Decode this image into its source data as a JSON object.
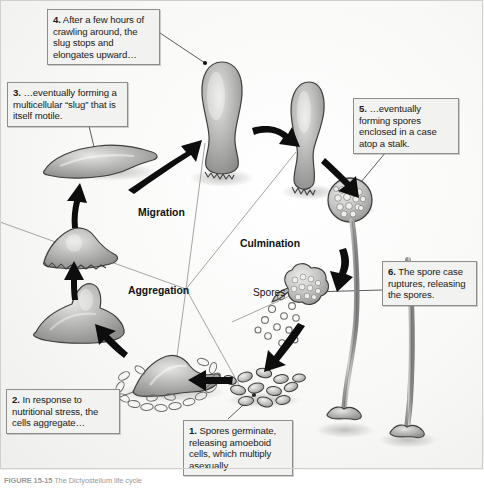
{
  "figure": {
    "caption": "FIGURE 15-15  The Dictyostelium life cycle",
    "background_color": "#ffffff",
    "body_fill_color": "#a8a8a8",
    "arrow_color": "#000000",
    "callout_fill": "#f2f2f0",
    "callout_border": "#8d8d8a"
  },
  "stages": [
    {
      "id": "migration",
      "label": "Migration"
    },
    {
      "id": "culmination",
      "label": "Culmination"
    },
    {
      "id": "aggregation",
      "label": "Aggregation"
    }
  ],
  "annotations": [
    {
      "id": "spores",
      "label": "Spores"
    }
  ],
  "steps": [
    {
      "number": "1.",
      "text": " Spores germinate, releasing amoeboid cells, which multiply asexually.",
      "full": "1. Spores germinate, releasing amoeboid cells, which multiply asexually."
    },
    {
      "number": "2.",
      "text": " In response to nutritional stress, the cells aggregate…",
      "full": "2. In response to nutritional stress, the cells aggregate…"
    },
    {
      "number": "3.",
      "text": " …eventually forming a multicellular “slug” that is itself motile.",
      "full": "3. …eventually forming a multicellular “slug” that is itself motile."
    },
    {
      "number": "4.",
      "text": " After a few hours of crawling around, the slug stops and elongates upward…",
      "full": "4. After a few hours of crawling around, the slug stops and elongates upward…"
    },
    {
      "number": "5.",
      "text": " …eventually forming spores enclosed in a case atop a stalk.",
      "full": "5. …eventually forming spores enclosed in a case atop a stalk."
    },
    {
      "number": "6.",
      "text": " The spore case ruptures, releasing the spores.",
      "full": "6. The spore case ruptures, releasing the spores."
    }
  ]
}
